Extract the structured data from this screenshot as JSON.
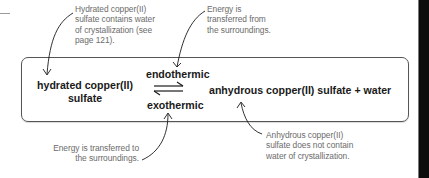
{
  "diagram": {
    "type": "reversible-reaction",
    "reactant": {
      "line1": "hydrated copper(II)",
      "line2": "sulfate"
    },
    "forward_condition": "endothermic",
    "reverse_condition": "exothermic",
    "product": "anhydrous copper(II) sulfate + water",
    "arrow_symbol": "equilibrium-harpoons"
  },
  "annotations": {
    "hydrated_note": {
      "lines": [
        "Hydrated copper(II)",
        "sulfate contains water",
        "of crystallization (see",
        "page 121)."
      ]
    },
    "endothermic_note": {
      "lines": [
        "Energy is",
        "transferred from",
        "the surroundings."
      ]
    },
    "exothermic_note": {
      "lines": [
        "Energy is transferred to",
        "the surroundings."
      ]
    },
    "anhydrous_note": {
      "lines": [
        "Anhydrous copper(II)",
        "sulfate does not contain",
        "water of crystallization."
      ]
    }
  },
  "colors": {
    "main_text": "#1a1a1a",
    "note_text": "#6b6b6b",
    "box_border": "#555555",
    "page_edge": "#0c0c0c"
  }
}
